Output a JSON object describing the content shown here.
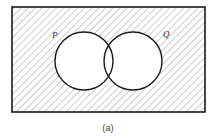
{
  "figure": {
    "caption": "(a)",
    "type": "venn-diagram"
  },
  "universal_set": {
    "shape": "rectangle",
    "shading": "diagonal-hatch",
    "border_color": "#1a1a1a",
    "hatch_color": "#9a9a9a",
    "fill_color": "#ffffff",
    "x": 12,
    "y": 7,
    "width": 193,
    "height": 105
  },
  "sets": [
    {
      "label": "P",
      "cx": 84,
      "cy": 61,
      "r": 29,
      "label_x": 52,
      "label_y": 38,
      "stroke_color": "#1a1a1a",
      "fill_color": "#ffffff"
    },
    {
      "label": "Q",
      "cx": 133,
      "cy": 61,
      "r": 29,
      "label_x": 163,
      "label_y": 37,
      "stroke_color": "#1a1a1a",
      "fill_color": "#ffffff"
    }
  ],
  "caption_position": {
    "x": 108,
    "y": 131
  }
}
